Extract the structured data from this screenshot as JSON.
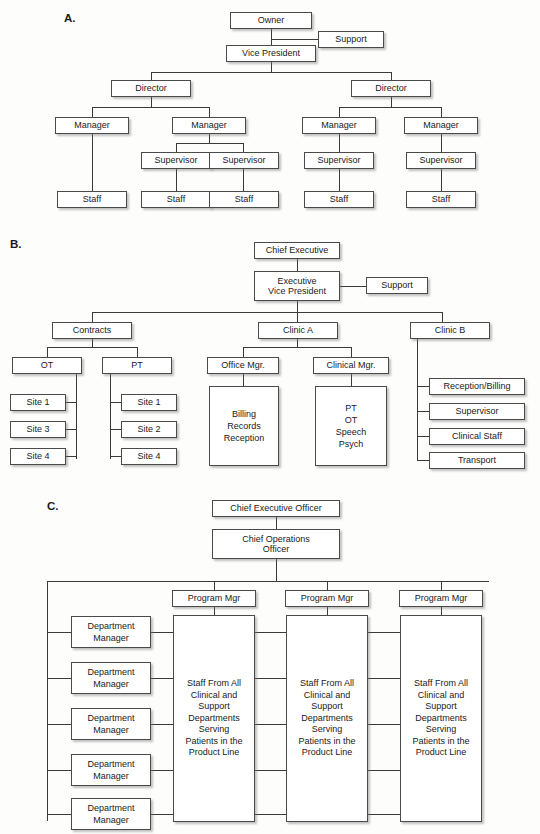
{
  "page": {
    "background_color": "#fdfdfc",
    "box_fill": "#ffffff",
    "box_border": "#4a4a4a",
    "line_color": "#3a3a3a",
    "text_color": "#1a1a1a"
  },
  "sections": {
    "a": {
      "label": "A.",
      "nodes": {
        "owner": "Owner",
        "support": "Support",
        "vice_president": "Vice President",
        "director_left": "Director",
        "director_right": "Director",
        "manager_1": "Manager",
        "manager_2": "Manager",
        "manager_3": "Manager",
        "manager_4": "Manager",
        "supervisor_1": "Supervisor",
        "supervisor_2": "Supervisor",
        "supervisor_3": "Supervisor",
        "supervisor_4": "Supervisor",
        "staff_1": "Staff",
        "staff_2": "Staff",
        "staff_3": "Staff",
        "staff_4": "Staff",
        "staff_5": "Staff"
      }
    },
    "b": {
      "label": "B.",
      "nodes": {
        "chief_executive": "Chief Executive",
        "executive_vice_president": "Executive\nVice President",
        "support": "Support",
        "contracts": "Contracts",
        "clinic_a": "Clinic A",
        "clinic_b": "Clinic B",
        "ot": "OT",
        "pt": "PT",
        "ot_site_1": "Site 1",
        "ot_site_3": "Site 3",
        "ot_site_4": "Site 4",
        "pt_site_1": "Site 1",
        "pt_site_2": "Site 2",
        "pt_site_4": "Site 4",
        "office_mgr": "Office Mgr.",
        "clinical_mgr": "Clinical Mgr.",
        "office_mgr_staff": "Billing\nRecords\nReception",
        "clinical_mgr_staff": "PT\nOT\nSpeech\nPsych",
        "clinic_b_reception_billing": "Reception/Billing",
        "clinic_b_supervisor": "Supervisor",
        "clinic_b_clinical_staff": "Clinical Staff",
        "clinic_b_transport": "Transport"
      }
    },
    "c": {
      "label": "C.",
      "nodes": {
        "ceo": "Chief Executive Officer",
        "coo": "Chief Operations\nOfficer",
        "program_mgr_1": "Program Mgr",
        "program_mgr_2": "Program Mgr",
        "program_mgr_3": "Program Mgr",
        "department_manager_1": "Department\nManager",
        "department_manager_2": "Department\nManager",
        "department_manager_3": "Department\nManager",
        "department_manager_4": "Department\nManager",
        "department_manager_5": "Department\nManager",
        "product_line_1": "Staff From All\nClinical and\nSupport\nDepartments\nServing\nPatients in the\nProduct Line",
        "product_line_2": "Staff From All\nClinical and\nSupport\nDepartments\nServing\nPatients in the\nProduct Line",
        "product_line_3": "Staff From All\nClinical and\nSupport\nDepartments\nServing\nPatients in the\nProduct Line"
      }
    }
  }
}
